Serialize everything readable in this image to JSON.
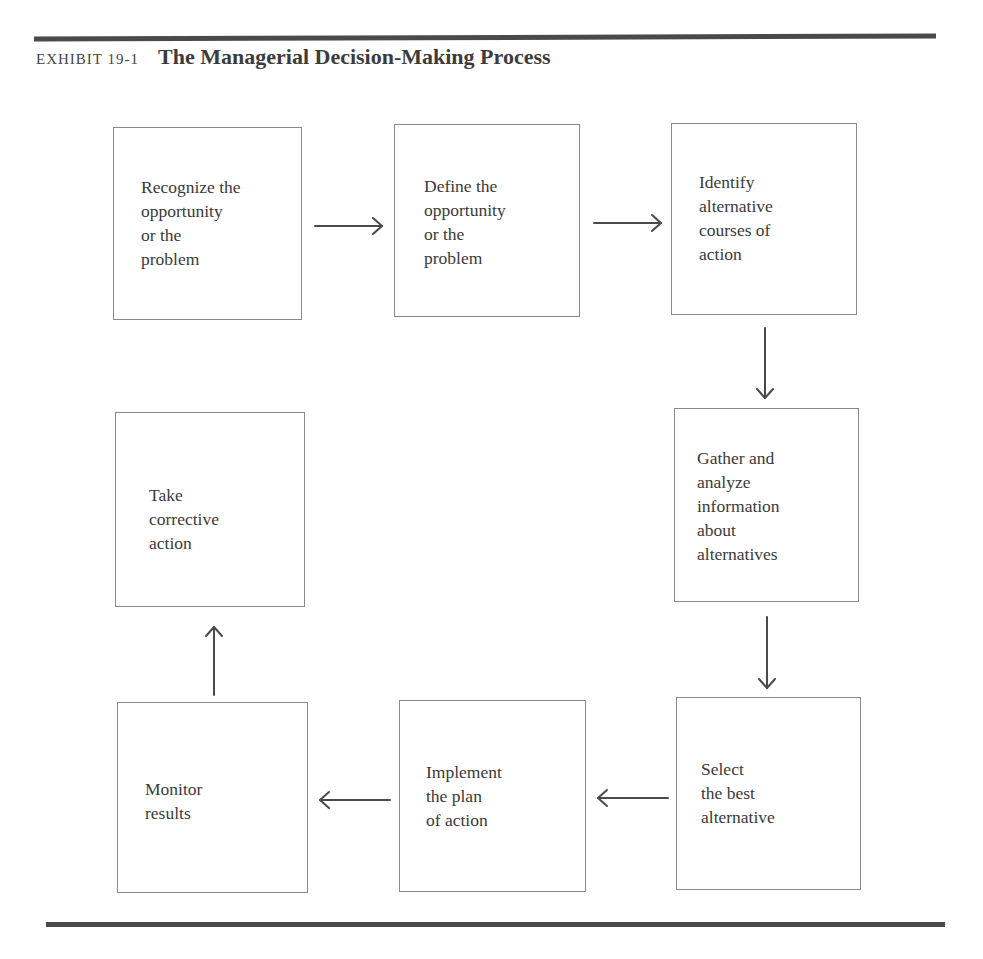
{
  "exhibit": {
    "label": "EXHIBIT 19-1",
    "title": "The Managerial Decision-Making Process"
  },
  "steps": [
    {
      "id": 1,
      "text": "Recognize the\nopportunity\nor the\nproblem"
    },
    {
      "id": 2,
      "text": "Define the\nopportunity\nor the\nproblem"
    },
    {
      "id": 3,
      "text": "Identify\nalternative\ncourses of\naction"
    },
    {
      "id": 4,
      "text": "Gather and\nanalyze\ninformation\nabout\nalternatives"
    },
    {
      "id": 5,
      "text": "Select\nthe best\nalternative"
    },
    {
      "id": 6,
      "text": "Implement\nthe plan\nof action"
    },
    {
      "id": 7,
      "text": "Monitor\nresults"
    },
    {
      "id": 8,
      "text": "Take\ncorrective\naction"
    }
  ],
  "flow": [
    {
      "from": 1,
      "to": 2,
      "direction": "right"
    },
    {
      "from": 2,
      "to": 3,
      "direction": "right"
    },
    {
      "from": 3,
      "to": 4,
      "direction": "down"
    },
    {
      "from": 4,
      "to": 5,
      "direction": "down"
    },
    {
      "from": 5,
      "to": 6,
      "direction": "left"
    },
    {
      "from": 6,
      "to": 7,
      "direction": "left"
    },
    {
      "from": 7,
      "to": 8,
      "direction": "up"
    }
  ],
  "colors": {
    "rule": "#4a4a4a",
    "box_border": "#8a8a8a",
    "text": "#3a3a3a",
    "arrow": "#4a4a4a"
  }
}
